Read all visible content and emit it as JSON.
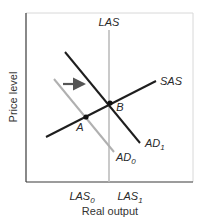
{
  "diagram": {
    "type": "aggregate-demand-supply",
    "axes": {
      "xlabel": "Real output",
      "ylabel": "Price level"
    },
    "curves": {
      "las": {
        "label": "LAS"
      },
      "sas": {
        "label": "SAS"
      },
      "ad0": {
        "label": "AD",
        "sub": "0"
      },
      "ad1": {
        "label": "AD",
        "sub": "1"
      }
    },
    "points": {
      "a": {
        "label": "A"
      },
      "b": {
        "label": "B"
      }
    },
    "x_ticks": {
      "las0": {
        "label": "LAS",
        "sub": "0"
      },
      "las1": {
        "label": "LAS",
        "sub": "1"
      }
    },
    "shift_arrow": {
      "direction": "right"
    },
    "colors": {
      "frame": "#3a3a3a",
      "dark_line": "#1e1e1e",
      "light_line": "#b0b0b0",
      "las_line": "#bdbdbd",
      "arrow": "#555555"
    }
  }
}
